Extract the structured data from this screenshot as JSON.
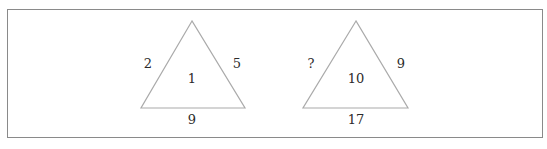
{
  "puzzle": {
    "triangles": [
      {
        "left": "2",
        "right": "5",
        "center": "1",
        "bottom": "9"
      },
      {
        "left": "?",
        "right": "9",
        "center": "10",
        "bottom": "17"
      }
    ]
  },
  "colors": {
    "border": "#8a8a8a",
    "triangle_stroke": "#aaaaaa",
    "text": "#2b2b2b"
  }
}
